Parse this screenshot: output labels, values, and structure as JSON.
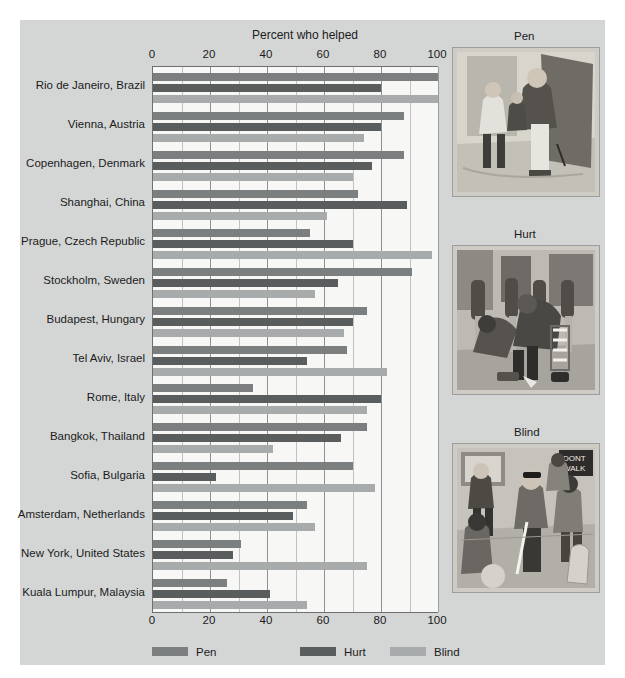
{
  "chart_data": {
    "type": "bar",
    "orientation": "horizontal",
    "title": "Percent who helped",
    "xlabel": "",
    "ylabel": "",
    "xlim": [
      0,
      100
    ],
    "xticks": [
      0,
      20,
      40,
      60,
      80,
      100
    ],
    "grid": true,
    "legend_position": "bottom",
    "categories": [
      "Rio de Janeiro, Brazil",
      "Vienna, Austria",
      "Copenhagen, Denmark",
      "Shanghai, China",
      "Prague, Czech Republic",
      "Stockholm, Sweden",
      "Budapest, Hungary",
      "Tel Aviv, Israel",
      "Rome, Italy",
      "Bangkok, Thailand",
      "Sofia, Bulgaria",
      "Amsterdam, Netherlands",
      "New York, United States",
      "Kuala Lumpur, Malaysia"
    ],
    "series": [
      {
        "name": "Pen",
        "color": "#7b7f80",
        "values": [
          100,
          88,
          88,
          72,
          55,
          91,
          75,
          68,
          35,
          75,
          70,
          54,
          31,
          26
        ]
      },
      {
        "name": "Hurt",
        "color": "#595d5e",
        "values": [
          80,
          80,
          77,
          89,
          70,
          65,
          70,
          54,
          80,
          66,
          22,
          49,
          28,
          41
        ]
      },
      {
        "name": "Blind",
        "color": "#a8abab",
        "values": [
          100,
          74,
          70,
          61,
          98,
          57,
          67,
          82,
          75,
          42,
          78,
          57,
          75,
          54
        ]
      }
    ]
  },
  "chart": {
    "title": "Percent who helped",
    "tick_labels": [
      "0",
      "20",
      "40",
      "60",
      "80",
      "100"
    ]
  },
  "legend": {
    "items": [
      {
        "label": "Pen",
        "swatch": "pen"
      },
      {
        "label": "Hurt",
        "swatch": "hurt"
      },
      {
        "label": "Blind",
        "swatch": "blind"
      }
    ]
  },
  "illustrations": [
    {
      "caption": "Pen",
      "name": "pen-illustration"
    },
    {
      "caption": "Hurt",
      "name": "hurt-illustration"
    },
    {
      "caption": "Blind",
      "name": "blind-illustration"
    }
  ],
  "colors": {
    "panel_background": "#d4d6d6",
    "plot_background": "#f7f7f5",
    "pen": "#7b7f80",
    "hurt": "#595d5e",
    "blind": "#a8abab"
  }
}
